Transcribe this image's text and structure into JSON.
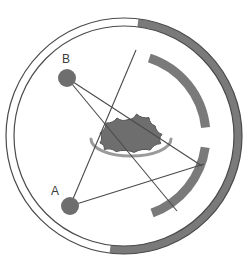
{
  "figure": {
    "type": "radar-coverage-diagram",
    "title": "",
    "canvas": {
      "width": 252,
      "height": 271
    },
    "colors": {
      "background": "#ffffff",
      "outline": "#4a4a4a",
      "ring_fill_active": "#7a7a7a",
      "ring_fill_inactive": "#ffffff",
      "sector_arc": "#7a7a7a",
      "blob_fill": "#6e6e6e",
      "blob_outline": "#565656",
      "saucer_arc": "#9a9a9a",
      "node_fill": "#6e6e6e",
      "line_stroke": "#4a4a4a",
      "label_text": "#3b3b3b"
    },
    "outer_ring": {
      "name": "outer-ring",
      "center": {
        "x": 124,
        "y": 136
      },
      "outer_radius": 118,
      "inner_radius": 110,
      "active_arc_start_deg": -83,
      "active_arc_end_deg": 97,
      "stroke_width": 1.2
    },
    "sector_arcs": [
      {
        "name": "upper-sector-arc",
        "center": {
          "x": 124,
          "y": 136
        },
        "radius": 82,
        "thickness": 9,
        "start_deg": -72,
        "end_deg": -6
      },
      {
        "name": "lower-sector-arc",
        "center": {
          "x": 124,
          "y": 136
        },
        "radius": 82,
        "thickness": 9,
        "start_deg": 8,
        "end_deg": 70
      }
    ],
    "center_blob": {
      "name": "cloud-blob",
      "center": {
        "x": 131,
        "y": 134
      },
      "width": 62,
      "height": 40
    },
    "saucer": {
      "name": "saucer-arc",
      "center": {
        "x": 131,
        "y": 142
      },
      "radius_x": 40,
      "radius_y": 17,
      "thickness": 3
    },
    "nodes": [
      {
        "id": "B",
        "name": "node-b",
        "label": "B",
        "x": 67,
        "y": 78,
        "radius": 9,
        "label_x": 66,
        "label_y": 60
      },
      {
        "id": "A",
        "name": "node-a",
        "label": "A",
        "x": 70,
        "y": 206,
        "radius": 9,
        "label_x": 55,
        "label_y": 192
      }
    ],
    "connector_lines": [
      {
        "name": "line-b-to-lower-tip",
        "x1": 67,
        "y1": 78,
        "x2": 177,
        "y2": 211
      },
      {
        "name": "line-b-to-mid-right",
        "x1": 67,
        "y1": 78,
        "x2": 202,
        "y2": 166
      },
      {
        "name": "line-a-to-upper-tip",
        "x1": 70,
        "y1": 206,
        "x2": 136,
        "y2": 50
      },
      {
        "name": "line-a-to-mid-right",
        "x1": 70,
        "y1": 206,
        "x2": 204,
        "y2": 164
      }
    ]
  }
}
